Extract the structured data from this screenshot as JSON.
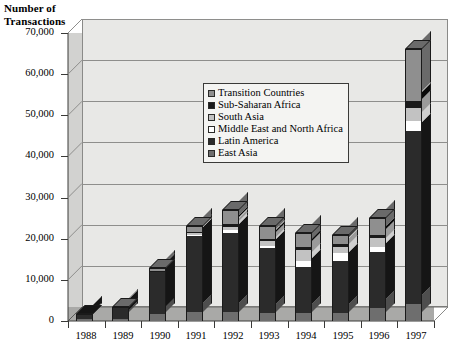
{
  "chart_data": {
    "type": "bar",
    "subtype": "stacked-column-3d",
    "title": "Number of Transactions",
    "xlabel": "",
    "ylabel": "Number of Transactions",
    "ylim": [
      0,
      70000
    ],
    "ytick_step": 10000,
    "ytick_labels": [
      "70,000",
      "60,000",
      "50,000",
      "40,000",
      "30,000",
      "20,000",
      "10,000",
      "0"
    ],
    "ytick_values": [
      70000,
      60000,
      50000,
      40000,
      30000,
      20000,
      10000,
      0
    ],
    "grid": true,
    "legend_position": "inside-upper-center",
    "categories": [
      "1988",
      "1989",
      "1990",
      "1991",
      "1992",
      "1993",
      "1994",
      "1995",
      "1996",
      "1997"
    ],
    "series": [
      {
        "name": "East Asia",
        "color": "#6e6e6e",
        "values": [
          400,
          600,
          1600,
          2100,
          2200,
          2000,
          2000,
          2000,
          3200,
          4200
        ]
      },
      {
        "name": "Latin America",
        "color": "#2b2b2b",
        "values": [
          1400,
          2600,
          10400,
          18500,
          19200,
          15800,
          11200,
          12600,
          13600,
          42000
        ]
      },
      {
        "name": "Middle East and North Africa",
        "color": "#ffffff",
        "values": [
          0,
          0,
          0,
          300,
          700,
          500,
          1400,
          1900,
          1300,
          2400
        ]
      },
      {
        "name": "South Asia",
        "color": "#c2c2c2",
        "values": [
          0,
          0,
          0,
          400,
          800,
          1200,
          2600,
          1500,
          2100,
          3100
        ]
      },
      {
        "name": "Sub-Saharan Africa",
        "color": "#1a1a1a",
        "values": [
          0,
          0,
          200,
          300,
          600,
          500,
          700,
          600,
          700,
          1800
        ]
      },
      {
        "name": "Transition Countries",
        "color": "#8f8f8f",
        "values": [
          0,
          300,
          800,
          1400,
          3500,
          3000,
          3600,
          2400,
          4100,
          12500
        ]
      }
    ],
    "totals": [
      1800,
      3500,
      13000,
      23000,
      27000,
      23000,
      21500,
      21000,
      25000,
      66000
    ]
  },
  "legend": {
    "items": [
      {
        "label": "Transition Countries",
        "swatch": "legend-swatch-transition"
      },
      {
        "label": "Sub-Saharan Africa",
        "swatch": "legend-swatch-subsaharan"
      },
      {
        "label": "South Asia",
        "swatch": "legend-swatch-southasia"
      },
      {
        "label": "Middle East and North Africa",
        "swatch": "legend-swatch-mena"
      },
      {
        "label": "Latin America",
        "swatch": "legend-swatch-latinamerica"
      },
      {
        "label": "East Asia",
        "swatch": "legend-swatch-eastasia"
      }
    ]
  },
  "axis_title": {
    "line1": "Number of",
    "line2": "Transactions"
  }
}
